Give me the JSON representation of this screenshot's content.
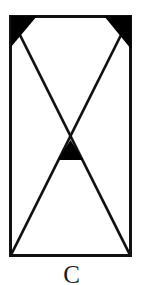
{
  "figure": {
    "caption": "C",
    "background_color": "#ffffff",
    "stroke_color": "#111111",
    "fill_color": "#000000",
    "canvas": {
      "width": 143,
      "height": 285
    },
    "rectangle": {
      "x": 9,
      "y": 15,
      "width": 123,
      "height": 242,
      "stroke_width": 3
    },
    "diagonals": [
      {
        "name": "diagonal-top-left-to-bottom-right",
        "x1": 11,
        "y1": 17,
        "x2": 130,
        "y2": 255
      },
      {
        "name": "diagonal-top-right-to-bottom-left",
        "x1": 130,
        "y1": 17,
        "x2": 11,
        "y2": 255
      }
    ],
    "crossing_point": {
      "x": 70.5,
      "y": 147
    },
    "filled_triangles": [
      {
        "name": "top-left-corner-triangle",
        "points": "11,17 36,17 11,46"
      },
      {
        "name": "top-right-corner-triangle",
        "points": "130,17 130,48 104,17"
      },
      {
        "name": "center-crossing-triangle",
        "points": "70.5,141 82,159 59,159"
      }
    ],
    "line_width": 2.6
  }
}
